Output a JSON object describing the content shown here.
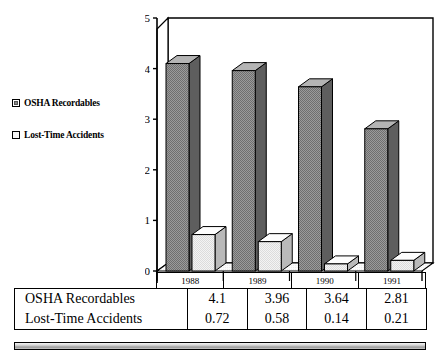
{
  "chart_data": {
    "type": "bar",
    "title": "",
    "subtitle": "",
    "xlabel": "",
    "ylabel": "",
    "categories": [
      "1988",
      "1989",
      "1990",
      "1991"
    ],
    "series": [
      {
        "name": "OSHA Recordables",
        "values": [
          4.1,
          3.96,
          3.64,
          2.81
        ],
        "color": "#8a8a8a"
      },
      {
        "name": "Lost-Time Accidents",
        "values": [
          0.72,
          0.58,
          0.14,
          0.21
        ],
        "color": "#e3e3e3"
      }
    ],
    "ylim": [
      0,
      5
    ],
    "yticks": [
      "0",
      "1",
      "2",
      "3",
      "4",
      "5"
    ],
    "grid": false,
    "legend_position": "left",
    "style": "3d-bar"
  },
  "legend": {
    "items": [
      {
        "label": "OSHA Recordables",
        "swatch": "#8a8a8a"
      },
      {
        "label": "Lost-Time Accidents",
        "swatch": "#f4f4f4"
      }
    ]
  },
  "axis": {
    "yticks": [
      "0",
      "1",
      "2",
      "3",
      "4",
      "5"
    ]
  },
  "table": {
    "header": [
      "",
      "1988",
      "1989",
      "1990",
      "1991"
    ],
    "rows": [
      {
        "label": "OSHA Recordables",
        "values": [
          "4.1",
          "3.96",
          "3.64",
          "2.81"
        ]
      },
      {
        "label": "Lost-Time Accidents",
        "values": [
          "0.72",
          "0.58",
          "0.14",
          "0.21"
        ]
      }
    ]
  },
  "colors": {
    "series_dark": "#8a8a8a",
    "series_light": "#e8e8e8",
    "outline": "#000000",
    "background": "#ffffff"
  }
}
